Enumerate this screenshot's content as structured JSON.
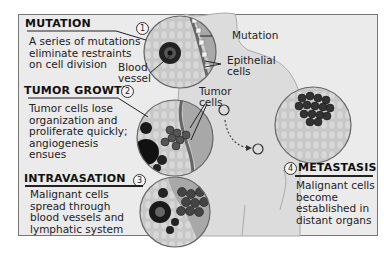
{
  "diagram": {
    "stages": [
      {
        "number": "1",
        "title": "MUTATION",
        "description": [
          "A series of mutations",
          "eliminate restraints",
          "on cell division"
        ]
      },
      {
        "number": "2",
        "title": "TUMOR GROWTH",
        "description": [
          "Tumor cells lose",
          "organization and",
          "proliferate quickly;",
          "angiogenesis",
          "ensues"
        ]
      },
      {
        "number": "3",
        "title": "INTRAVASATION",
        "description": [
          "Malignant cells",
          "spread through",
          "blood vessels and",
          "lymphatic system"
        ]
      },
      {
        "number": "4",
        "title": "METASTASIS",
        "description": [
          "Malignant cells",
          "become",
          "established in",
          "distant organs"
        ]
      }
    ],
    "callouts": {
      "blood_vessel": [
        "Blood",
        "vessel"
      ],
      "mutation": "Mutation",
      "epithelial": [
        "Epithelial",
        "cells"
      ],
      "tumor_cells": [
        "Tumor",
        "cells"
      ]
    },
    "colors": {
      "background": "#ebebeb",
      "frame_border": "#777777",
      "tissue": "#c9c9c9",
      "epithelium": "#9a9a9a",
      "cell_dark": "#333333",
      "text": "#111111"
    }
  }
}
